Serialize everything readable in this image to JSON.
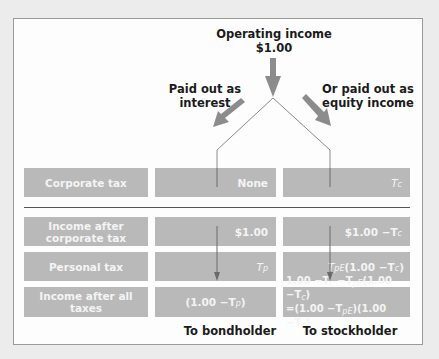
{
  "diagram": {
    "top_label": {
      "line1": "Operating income",
      "line2": "$1.00"
    },
    "left_branch": {
      "line1": "Paid out as",
      "line2": "interest"
    },
    "right_branch": {
      "line1": "Or paid out as",
      "line2": "equity income"
    },
    "rows": [
      {
        "label": "Corporate tax",
        "bond": "None",
        "stock_main": "T",
        "stock_sub": "c"
      },
      {
        "label_line1": "Income after",
        "label_line2": "corporate tax",
        "bond": "$1.00",
        "stock_main": "$1.00 −T",
        "stock_sub": "c"
      },
      {
        "label": "Personal tax",
        "bond_main": "T",
        "bond_sub": "p",
        "stock_main": "T",
        "stock_sub": "pE",
        "stock_tail": "(1.00 −T",
        "stock_tail_sub": "c",
        "stock_end": ")"
      },
      {
        "label": "Income after all taxes",
        "bond_pre": "(1.00 −T",
        "bond_sub": "p",
        "bond_end": ")",
        "stock_line1": {
          "a": "1.00 −T",
          "a_sub": "c",
          "b": " −T",
          "b_sub": "pE",
          "c": "(1.00 −T",
          "c_sub": "c",
          "d": ")"
        },
        "stock_line2": {
          "a": "=(1.00 −T",
          "a_sub": "pE",
          "b": ")(1.00 −T",
          "b_sub": "c",
          "c": ")"
        }
      }
    ],
    "captions": {
      "bond": "To bondholder",
      "stock": "To stockholder"
    },
    "colors": {
      "box_fill": "#b9b9b9",
      "box_text": "#f4f4f4",
      "arrow": "#8c8c8c",
      "line": "#8a8a8a",
      "frame": "#9a9a9a"
    }
  }
}
